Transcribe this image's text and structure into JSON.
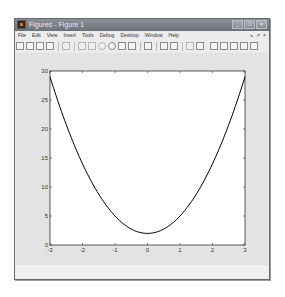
{
  "window": {
    "title": "Figures - Figure 1",
    "controls": [
      "minimize",
      "maximize",
      "close"
    ]
  },
  "menubar": {
    "items": [
      "File",
      "Edit",
      "View",
      "Insert",
      "Tools",
      "Debug",
      "Desktop",
      "Window",
      "Help"
    ],
    "right_controls": [
      "undock-arrow",
      "dock-arrow",
      "close-x"
    ]
  },
  "toolbar": {
    "icons": [
      "new-figure-icon",
      "open-file-icon",
      "save-icon",
      "print-icon",
      "pointer-icon",
      "zoom-in-icon",
      "zoom-out-icon",
      "pan-icon",
      "rotate-3d-icon",
      "data-cursor-icon",
      "brush-icon",
      "link-plot-icon",
      "colorbar-icon",
      "legend-icon",
      "hide-plot-tools-icon",
      "show-plot-tools-icon",
      "tile-grid-icon",
      "tile-columns-icon",
      "tile-rows-icon",
      "float-icon",
      "maximize-icon"
    ]
  },
  "chart_data": {
    "type": "line",
    "title": "",
    "xlabel": "",
    "ylabel": "",
    "xlim": [
      -3,
      3
    ],
    "ylim": [
      0,
      30
    ],
    "xticks": [
      -3,
      -2,
      -1,
      0,
      1,
      2,
      3
    ],
    "yticks": [
      0,
      5,
      10,
      15,
      20,
      25,
      30
    ],
    "grid": false,
    "legend": null,
    "series": [
      {
        "name": "y = 3x^2 + 2",
        "x": [
          -3,
          -2.5,
          -2,
          -1.5,
          -1,
          -0.5,
          0,
          0.5,
          1,
          1.5,
          2,
          2.5,
          3
        ],
        "y": [
          29,
          20.75,
          14,
          8.75,
          5,
          2.75,
          2,
          2.75,
          5,
          8.75,
          14,
          20.75,
          29
        ],
        "color": "#000000"
      }
    ]
  },
  "colors": {
    "figure_bg": "#e3e3e3",
    "axes_bg": "#ffffff",
    "line": "#000000",
    "titlebar": "#7b7f88"
  }
}
